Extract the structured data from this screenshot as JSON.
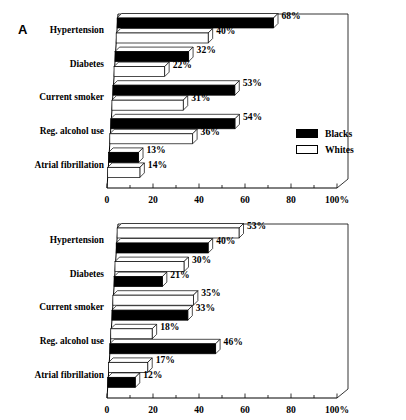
{
  "figure": {
    "panels": [
      {
        "letter": "A",
        "legend": [
          {
            "label": "Blacks",
            "fill": "black"
          },
          {
            "label": "Whites",
            "fill": "white"
          }
        ],
        "axis": {
          "ticks": [
            "0",
            "20",
            "40",
            "60",
            "80",
            "100%"
          ],
          "tick_values": [
            0,
            20,
            40,
            60,
            80,
            100
          ],
          "minor_step": 10
        },
        "categories": [
          "Hypertension",
          "Diabetes",
          "Current smoker",
          "Reg. alcohol use",
          "Atrial fibrillation"
        ],
        "bars": [
          {
            "category": "Hypertension",
            "series": "Blacks",
            "value": 68,
            "label": "68%",
            "fill": "black"
          },
          {
            "category": "Hypertension",
            "series": "Whites",
            "value": 40,
            "label": "40%",
            "fill": "white"
          },
          {
            "category": "Diabetes",
            "series": "Blacks",
            "value": 32,
            "label": "32%",
            "fill": "black"
          },
          {
            "category": "Diabetes",
            "series": "Whites",
            "value": 22,
            "label": "22%",
            "fill": "white"
          },
          {
            "category": "Current smoker",
            "series": "Blacks",
            "value": 53,
            "label": "53%",
            "fill": "black"
          },
          {
            "category": "Current smoker",
            "series": "Whites",
            "value": 31,
            "label": "31%",
            "fill": "white"
          },
          {
            "category": "Reg. alcohol use",
            "series": "Blacks",
            "value": 54,
            "label": "54%",
            "fill": "black"
          },
          {
            "category": "Reg. alcohol use",
            "series": "Whites",
            "value": 36,
            "label": "36%",
            "fill": "white"
          },
          {
            "category": "Atrial fibrillation",
            "series": "Blacks",
            "value": 13,
            "label": "13%",
            "fill": "black"
          },
          {
            "category": "Atrial fibrillation",
            "series": "Whites",
            "value": 14,
            "label": "14%",
            "fill": "white"
          }
        ]
      },
      {
        "letter": "B",
        "legend": [
          {
            "label": "Females",
            "fill": "white"
          },
          {
            "label": "Males",
            "fill": "black"
          }
        ],
        "axis": {
          "ticks": [
            "0",
            "20",
            "40",
            "60",
            "80",
            "100%"
          ],
          "tick_values": [
            0,
            20,
            40,
            60,
            80,
            100
          ],
          "minor_step": 10
        },
        "categories": [
          "Hypertension",
          "Diabetes",
          "Current smoker",
          "Reg. alcohol use",
          "Atrial fibrillation"
        ],
        "bars": [
          {
            "category": "Hypertension",
            "series": "Females",
            "value": 53,
            "label": "53%",
            "fill": "white"
          },
          {
            "category": "Hypertension",
            "series": "Males",
            "value": 40,
            "label": "40%",
            "fill": "black"
          },
          {
            "category": "Diabetes",
            "series": "Females",
            "value": 30,
            "label": "30%",
            "fill": "white"
          },
          {
            "category": "Diabetes",
            "series": "Males",
            "value": 21,
            "label": "21%",
            "fill": "black"
          },
          {
            "category": "Current smoker",
            "series": "Females",
            "value": 35,
            "label": "35%",
            "fill": "white"
          },
          {
            "category": "Current smoker",
            "series": "Males",
            "value": 33,
            "label": "33%",
            "fill": "black"
          },
          {
            "category": "Reg. alcohol use",
            "series": "Females",
            "value": 18,
            "label": "18%",
            "fill": "white"
          },
          {
            "category": "Reg. alcohol use",
            "series": "Males",
            "value": 46,
            "label": "46%",
            "fill": "black"
          },
          {
            "category": "Atrial fibrillation",
            "series": "Females",
            "value": 17,
            "label": "17%",
            "fill": "white"
          },
          {
            "category": "Atrial fibrillation",
            "series": "Males",
            "value": 12,
            "label": "12%",
            "fill": "black"
          }
        ]
      }
    ]
  },
  "chart_data": [
    {
      "type": "bar",
      "orientation": "horizontal",
      "panel": "A",
      "title": "",
      "xlabel": "",
      "ylabel": "",
      "xlim": [
        0,
        100
      ],
      "grid": false,
      "legend_position": "inside-right",
      "xtick_labels": [
        "0",
        "20",
        "40",
        "60",
        "80",
        "100%"
      ],
      "xticks": [
        0,
        20,
        40,
        60,
        80,
        100
      ],
      "categories": [
        "Hypertension",
        "Diabetes",
        "Current smoker",
        "Reg. alcohol use",
        "Atrial fibrillation"
      ],
      "series": [
        {
          "name": "Blacks",
          "fill": "black",
          "values": [
            68,
            32,
            53,
            54,
            13
          ],
          "labels": [
            "68%",
            "32%",
            "53%",
            "54%",
            "13%"
          ]
        },
        {
          "name": "Whites",
          "fill": "white",
          "values": [
            40,
            22,
            31,
            36,
            14
          ],
          "labels": [
            "40%",
            "22%",
            "31%",
            "36%",
            "14%"
          ]
        }
      ]
    },
    {
      "type": "bar",
      "orientation": "horizontal",
      "panel": "B",
      "title": "",
      "xlabel": "",
      "ylabel": "",
      "xlim": [
        0,
        100
      ],
      "grid": false,
      "legend_position": "inside-right",
      "xtick_labels": [
        "0",
        "20",
        "40",
        "60",
        "80",
        "100%"
      ],
      "xticks": [
        0,
        20,
        40,
        60,
        80,
        100
      ],
      "categories": [
        "Hypertension",
        "Diabetes",
        "Current smoker",
        "Reg. alcohol use",
        "Atrial fibrillation"
      ],
      "series": [
        {
          "name": "Females",
          "fill": "white",
          "values": [
            53,
            30,
            35,
            18,
            17
          ],
          "labels": [
            "53%",
            "30%",
            "35%",
            "18%",
            "17%"
          ]
        },
        {
          "name": "Males",
          "fill": "black",
          "values": [
            40,
            21,
            33,
            46,
            12
          ],
          "labels": [
            "40%",
            "21%",
            "33%",
            "46%",
            "12%"
          ]
        }
      ]
    }
  ]
}
